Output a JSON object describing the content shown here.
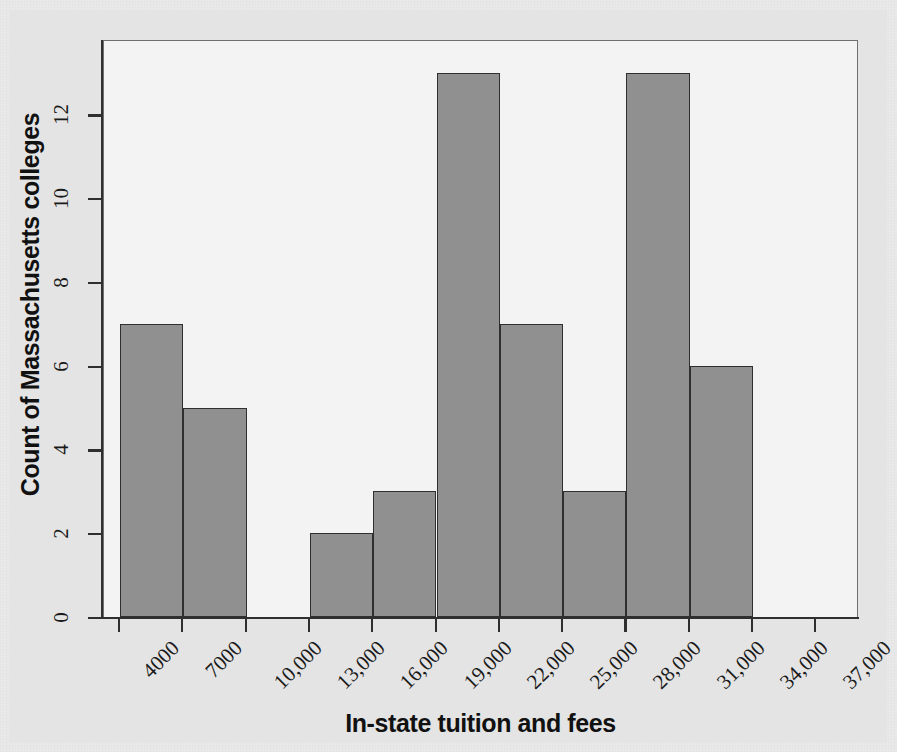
{
  "chart_data": {
    "type": "bar",
    "title": "",
    "xlabel": "In-state tuition and fees",
    "ylabel": "Count of Massachusetts colleges",
    "bin_width": 3000,
    "bin_edges": [
      4000,
      7000,
      10000,
      13000,
      16000,
      19000,
      22000,
      25000,
      28000,
      31000,
      34000,
      37000
    ],
    "categories": [
      "4000-7000",
      "7000-10,000",
      "10,000-13,000",
      "13,000-16,000",
      "16,000-19,000",
      "19,000-22,000",
      "22,000-25,000",
      "25,000-28,000",
      "28,000-31,000",
      "31,000-34,000",
      "34,000-37,000"
    ],
    "values": [
      7,
      5,
      0,
      2,
      3,
      13,
      7,
      3,
      13,
      6,
      0
    ],
    "xtick_labels": [
      "4000",
      "7000",
      "10,000",
      "13,000",
      "16,000",
      "19,000",
      "22,000",
      "25,000",
      "28,000",
      "31,000",
      "34,000",
      "37,000"
    ],
    "ytick_labels": [
      "0",
      "2",
      "4",
      "6",
      "8",
      "10",
      "12"
    ],
    "ytick_values": [
      0,
      2,
      4,
      6,
      8,
      10,
      12
    ],
    "ylim": [
      0,
      13.8
    ],
    "xlim": [
      4000,
      37000
    ],
    "grid": false,
    "legend": null,
    "colors": {
      "bar_fill": "#909090",
      "bar_edge": "#2f2f2f",
      "panel_background": "#f3f3f3",
      "figure_background": "#e4e4e4",
      "axis": "#2f2f2f",
      "text": "#111111"
    }
  }
}
